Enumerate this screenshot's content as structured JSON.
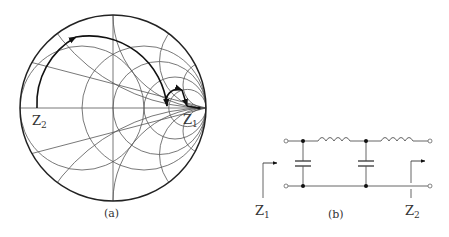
{
  "figure_a": {
    "caption": "(a)",
    "type": "smith-chart",
    "labels": {
      "z1": "Z",
      "z1_sub": "1",
      "z2": "Z",
      "z2_sub": "2"
    },
    "colors": {
      "grid": "#555555",
      "path": "#111111",
      "background": "#ffffff"
    }
  },
  "figure_b": {
    "caption": "(b)",
    "type": "ladder-network",
    "components": [
      "shunt-capacitor",
      "series-inductor",
      "shunt-capacitor",
      "series-inductor"
    ],
    "labels": {
      "z1": "Z",
      "z1_sub": "1",
      "z2": "Z",
      "z2_sub": "2"
    }
  }
}
